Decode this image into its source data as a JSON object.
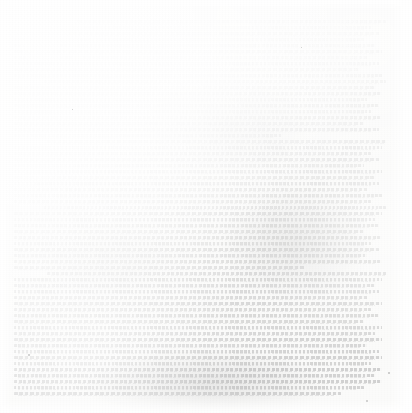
{
  "document": {
    "kind": "scanned-page",
    "legibility": "illegible",
    "condition_note": "severely faded grayscale scan; no text is readable",
    "page_width_px": 412,
    "page_height_px": 413,
    "paper_color": "#fbfbfa",
    "ink_color": "#cfcfcf",
    "text_block": {
      "left_px": 14,
      "top_px": 19,
      "right_px": 386,
      "bottom_px": 399,
      "line_pitch_px": 6,
      "line_count": 63,
      "columns": 1,
      "alignment": "justified"
    },
    "margins": {
      "top_px": 19,
      "left_px": 14,
      "right_px": 26,
      "bottom_px": 14
    },
    "lines": [
      {
        "indent": 9,
        "width": 91,
        "ink": 0.18
      },
      {
        "indent": 0,
        "width": 96,
        "ink": 0.2
      },
      {
        "indent": 0,
        "width": 98,
        "ink": 0.24
      },
      {
        "indent": 0,
        "width": 94,
        "ink": 0.22
      },
      {
        "indent": 0,
        "width": 97,
        "ink": 0.28
      },
      {
        "indent": 0,
        "width": 99,
        "ink": 0.3
      },
      {
        "indent": 0,
        "width": 95,
        "ink": 0.26
      },
      {
        "indent": 0,
        "width": 98,
        "ink": 0.32
      },
      {
        "indent": 0,
        "width": 93,
        "ink": 0.29
      },
      {
        "indent": 0,
        "width": 99,
        "ink": 0.34
      },
      {
        "indent": 8,
        "width": 92,
        "ink": 0.31
      },
      {
        "indent": 0,
        "width": 97,
        "ink": 0.36
      },
      {
        "indent": 0,
        "width": 99,
        "ink": 0.38
      },
      {
        "indent": 0,
        "width": 95,
        "ink": 0.33
      },
      {
        "indent": 0,
        "width": 98,
        "ink": 0.4
      },
      {
        "indent": 0,
        "width": 96,
        "ink": 0.35
      },
      {
        "indent": 0,
        "width": 99,
        "ink": 0.42
      },
      {
        "indent": 0,
        "width": 94,
        "ink": 0.37
      },
      {
        "indent": 0,
        "width": 98,
        "ink": 0.44
      },
      {
        "indent": 0,
        "width": 72,
        "ink": 0.39
      },
      {
        "indent": 9,
        "width": 93,
        "ink": 0.41
      },
      {
        "indent": 0,
        "width": 99,
        "ink": 0.46
      },
      {
        "indent": 0,
        "width": 96,
        "ink": 0.43
      },
      {
        "indent": 0,
        "width": 98,
        "ink": 0.48
      },
      {
        "indent": 0,
        "width": 94,
        "ink": 0.45
      },
      {
        "indent": 0,
        "width": 99,
        "ink": 0.5
      },
      {
        "indent": 0,
        "width": 97,
        "ink": 0.47
      },
      {
        "indent": 0,
        "width": 98,
        "ink": 0.52
      },
      {
        "indent": 0,
        "width": 95,
        "ink": 0.49
      },
      {
        "indent": 0,
        "width": 99,
        "ink": 0.54
      },
      {
        "indent": 0,
        "width": 96,
        "ink": 0.51
      },
      {
        "indent": 8,
        "width": 92,
        "ink": 0.53
      },
      {
        "indent": 0,
        "width": 99,
        "ink": 0.57
      },
      {
        "indent": 0,
        "width": 97,
        "ink": 0.55
      },
      {
        "indent": 0,
        "width": 98,
        "ink": 0.59
      },
      {
        "indent": 0,
        "width": 94,
        "ink": 0.56
      },
      {
        "indent": 0,
        "width": 99,
        "ink": 0.61
      },
      {
        "indent": 0,
        "width": 96,
        "ink": 0.58
      },
      {
        "indent": 0,
        "width": 98,
        "ink": 0.63
      },
      {
        "indent": 0,
        "width": 95,
        "ink": 0.6
      },
      {
        "indent": 0,
        "width": 99,
        "ink": 0.65
      },
      {
        "indent": 0,
        "width": 78,
        "ink": 0.62
      },
      {
        "indent": 9,
        "width": 94,
        "ink": 0.64
      },
      {
        "indent": 0,
        "width": 99,
        "ink": 0.68
      },
      {
        "indent": 0,
        "width": 97,
        "ink": 0.66
      },
      {
        "indent": 0,
        "width": 98,
        "ink": 0.71
      },
      {
        "indent": 0,
        "width": 95,
        "ink": 0.69
      },
      {
        "indent": 0,
        "width": 99,
        "ink": 0.73
      },
      {
        "indent": 0,
        "width": 96,
        "ink": 0.7
      },
      {
        "indent": 0,
        "width": 98,
        "ink": 0.75
      },
      {
        "indent": 0,
        "width": 94,
        "ink": 0.72
      },
      {
        "indent": 0,
        "width": 99,
        "ink": 0.78
      },
      {
        "indent": 0,
        "width": 97,
        "ink": 0.76
      },
      {
        "indent": 0,
        "width": 99,
        "ink": 0.82
      },
      {
        "indent": 0,
        "width": 95,
        "ink": 0.79
      },
      {
        "indent": 0,
        "width": 98,
        "ink": 0.85
      },
      {
        "indent": 0,
        "width": 99,
        "ink": 0.88
      },
      {
        "indent": 0,
        "width": 96,
        "ink": 0.84
      },
      {
        "indent": 0,
        "width": 99,
        "ink": 0.91
      },
      {
        "indent": 0,
        "width": 97,
        "ink": 0.87
      },
      {
        "indent": 0,
        "width": 99,
        "ink": 0.93
      },
      {
        "indent": 0,
        "width": 94,
        "ink": 0.86
      },
      {
        "indent": 0,
        "width": 88,
        "ink": 0.8
      }
    ],
    "specks": [
      {
        "x": 28,
        "y": 354,
        "size": 2.0
      },
      {
        "x": 366,
        "y": 400,
        "size": 2.4
      },
      {
        "x": 388,
        "y": 372,
        "size": 1.6
      },
      {
        "x": 72,
        "y": 109,
        "size": 1.4
      },
      {
        "x": 301,
        "y": 47,
        "size": 1.3
      }
    ]
  }
}
